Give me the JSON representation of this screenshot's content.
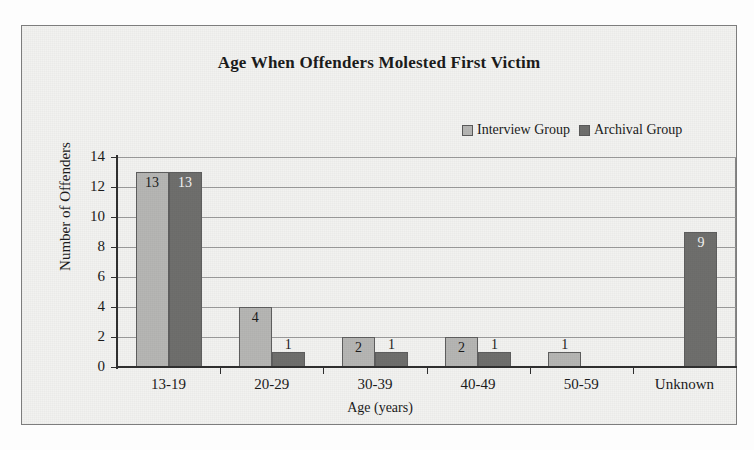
{
  "chart_data": {
    "type": "bar",
    "title": "Age When Offenders Molested First Victim",
    "xlabel": "Age (years)",
    "ylabel": "Number of Offenders",
    "ylim": [
      0,
      14
    ],
    "ytick_step": 2,
    "yticks": [
      "0",
      "2",
      "4",
      "6",
      "8",
      "10",
      "12",
      "14"
    ],
    "grid": "horizontal",
    "legend_position": "top-right",
    "categories": [
      "13-19",
      "20-29",
      "30-39",
      "40-49",
      "50-59",
      "Unknown"
    ],
    "series": [
      {
        "name": "Interview Group",
        "color": "#b6b6b4",
        "values": [
          13,
          4,
          2,
          2,
          1,
          0
        ],
        "labels": [
          "13",
          "4",
          "2",
          "2",
          "1",
          ""
        ]
      },
      {
        "name": "Archival Group",
        "color": "#6f6f6d",
        "values": [
          13,
          1,
          1,
          1,
          0,
          9
        ],
        "labels": [
          "13",
          "1",
          "1",
          "1",
          "",
          "9"
        ]
      }
    ]
  },
  "colors": {
    "interview_group": "#b6b6b4",
    "archival_group": "#6f6f6d",
    "axis": "#303030",
    "gridline": "#9a9a9a",
    "frame": "#7d7d7d",
    "page_background": "#f2f2f0",
    "text": "#1b1b1b"
  },
  "icons": {
    "legend_swatch_interview": "square-swatch-light-icon",
    "legend_swatch_archival": "square-swatch-dark-icon"
  }
}
